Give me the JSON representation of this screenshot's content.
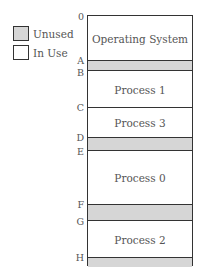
{
  "legend": {
    "unused": {
      "label": "Unused",
      "color": "#d6d6d6"
    },
    "in_use": {
      "label": "In Use",
      "color": "#ffffff"
    }
  },
  "memory": {
    "segments": [
      {
        "label": "Operating System",
        "state": "in_use",
        "top": 0,
        "height": 45
      },
      {
        "label": "",
        "state": "unused",
        "top": 45,
        "height": 10
      },
      {
        "label": "Process 1",
        "state": "in_use",
        "top": 55,
        "height": 37
      },
      {
        "label": "Process 3",
        "state": "in_use",
        "top": 92,
        "height": 30
      },
      {
        "label": "",
        "state": "unused",
        "top": 122,
        "height": 13
      },
      {
        "label": "Process 0",
        "state": "in_use",
        "top": 135,
        "height": 54
      },
      {
        "label": "",
        "state": "unused",
        "top": 189,
        "height": 16
      },
      {
        "label": "Process 2",
        "state": "in_use",
        "top": 205,
        "height": 37
      },
      {
        "label": "",
        "state": "unused",
        "top": 242,
        "height": 9
      }
    ],
    "addresses": [
      {
        "label": "0",
        "y": 15
      },
      {
        "label": "A",
        "y": 60
      },
      {
        "label": "B",
        "y": 70
      },
      {
        "label": "C",
        "y": 107
      },
      {
        "label": "D",
        "y": 137
      },
      {
        "label": "E",
        "y": 150
      },
      {
        "label": "F",
        "y": 204
      },
      {
        "label": "G",
        "y": 220
      },
      {
        "label": "H",
        "y": 257
      }
    ]
  }
}
